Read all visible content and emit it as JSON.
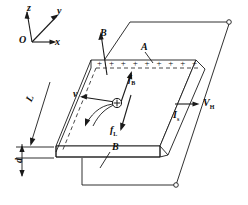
{
  "figure": {
    "stroke_color": "#1a1a1a",
    "background": "#ffffff"
  },
  "axes": {
    "origin_label": "O",
    "z_label": "z",
    "y_label": "y",
    "x_label": "x"
  },
  "labels": {
    "magnetic_field_top": "B",
    "magnetic_field_bottom": "B",
    "surface_A": "A",
    "force_magnetic": "f",
    "force_magnetic_sub": "B",
    "force_lorentz": "f",
    "force_lorentz_sub": "L",
    "velocity": "v",
    "current": "I",
    "current_sub": "s",
    "hall_voltage": "V",
    "hall_voltage_sub": "H",
    "length": "L",
    "thickness": "d"
  },
  "charges": {
    "symbol": "+",
    "count": 9,
    "carrier_symbol": "+"
  }
}
